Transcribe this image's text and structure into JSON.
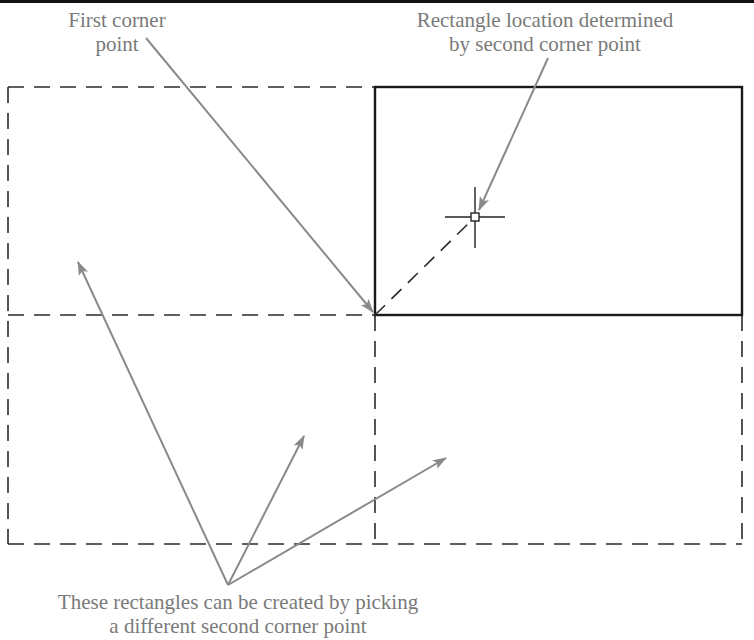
{
  "diagram": {
    "colors": {
      "background": "#ffffff",
      "outline_solid": "#1a1a1a",
      "outline_dashed": "#2a2a2a",
      "leader": "#8a8a8a",
      "text": "#7a7a7a",
      "top_bar": "#111111"
    },
    "labels": {
      "first_corner": {
        "line1": "First corner",
        "line2": "point"
      },
      "rect_location": {
        "line1": "Rectangle location determined",
        "line2": "by second corner point"
      },
      "other_rects": {
        "line1": "These rectangles can be created by picking",
        "line2": "a different second corner point"
      }
    },
    "geometry": {
      "outer_dashed_rect": {
        "x1": 8,
        "y1": 87,
        "x2": 742,
        "y2": 544
      },
      "mid_horizontal_y": 315,
      "mid_vertical_x": 375,
      "solid_rect": {
        "x1": 375,
        "y1": 87,
        "x2": 742,
        "y2": 315
      },
      "first_corner": {
        "x": 375,
        "y": 315
      },
      "crosshair": {
        "x": 475,
        "y": 217,
        "arm": 30,
        "box": 7
      }
    },
    "elements": [
      {
        "name": "solid-rectangle",
        "type": "rectangle",
        "style": "solid"
      },
      {
        "name": "dashed-rectangle-top-left",
        "type": "rectangle",
        "style": "dashed"
      },
      {
        "name": "dashed-rectangle-bottom-left",
        "type": "rectangle",
        "style": "dashed"
      },
      {
        "name": "dashed-rectangle-bottom-right",
        "type": "rectangle",
        "style": "dashed"
      },
      {
        "name": "crosshair-cursor-icon",
        "type": "cursor"
      },
      {
        "name": "rubber-band-line",
        "type": "line",
        "style": "dashed"
      }
    ]
  }
}
